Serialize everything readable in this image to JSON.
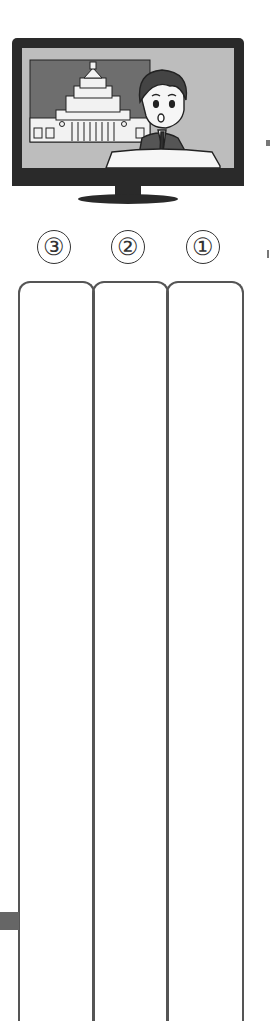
{
  "illustration": {
    "subject": "tv-news-broadcast",
    "elements": [
      "tv-frame",
      "tv-stand",
      "parliament-building",
      "news-anchor",
      "news-desk"
    ],
    "colors": {
      "frame": "#2a2a2a",
      "screen": "#bdbdbd",
      "backdrop": "#6e6e6e",
      "building": "#f2f2f2",
      "ink": "#222222"
    }
  },
  "answer_columns": [
    {
      "label": "③",
      "position": "left"
    },
    {
      "label": "②",
      "position": "middle"
    },
    {
      "label": "①",
      "position": "right"
    }
  ],
  "colors": {
    "border": "#555555",
    "marker": "#666666"
  }
}
